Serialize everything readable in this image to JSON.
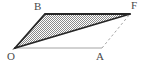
{
  "figure": {
    "type": "geometry-diagram",
    "background_color": "#ffffff",
    "labels": {
      "O": "O",
      "B": "B",
      "F": "F",
      "A": "A"
    },
    "label_color": "#4a4a4a",
    "vertices": {
      "O": {
        "x": 15,
        "y": 48
      },
      "B": {
        "x": 45,
        "y": 14
      },
      "F": {
        "x": 130,
        "y": 14
      },
      "A": {
        "x": 102,
        "y": 48
      }
    },
    "shaded_region": {
      "name": "triangle-OBF",
      "points": "15,48 45,14 130,14",
      "fill_pattern": "checkered-hatch",
      "pattern_color": "#8a8a8a",
      "pattern_background": "#ffffff",
      "stroke_color": "#262626",
      "stroke_width": 1.8
    },
    "edges": [
      {
        "name": "edge-O-B",
        "from": "O",
        "to": "B",
        "style": "solid",
        "color": "#262626",
        "width": 1.8
      },
      {
        "name": "edge-B-F",
        "from": "B",
        "to": "F",
        "style": "solid",
        "color": "#262626",
        "width": 1.8
      },
      {
        "name": "edge-F-O",
        "from": "F",
        "to": "O",
        "style": "solid",
        "color": "#262626",
        "width": 1.8
      },
      {
        "name": "edge-O-A",
        "from": "O",
        "to": "A",
        "style": "solid",
        "color": "#9a9a9a",
        "width": 0.9
      },
      {
        "name": "edge-A-F",
        "from": "A",
        "to": "F",
        "style": "dashed",
        "color": "#9a9a9a",
        "width": 0.9,
        "dash": "2.5,2.5"
      }
    ]
  }
}
